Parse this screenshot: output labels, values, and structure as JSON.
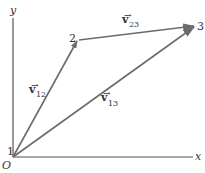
{
  "diagram": {
    "axes": {
      "x_label": "x",
      "y_label": "y",
      "origin_label": "O"
    },
    "points": [
      {
        "id": "1",
        "label": "1"
      },
      {
        "id": "2",
        "label": "2"
      },
      {
        "id": "3",
        "label": "3"
      }
    ],
    "vectors": [
      {
        "from": "1",
        "to": "2",
        "symbol": "v",
        "subscript": "12"
      },
      {
        "from": "2",
        "to": "3",
        "symbol": "v",
        "subscript": "23"
      },
      {
        "from": "1",
        "to": "3",
        "symbol": "v",
        "subscript": "13"
      }
    ],
    "colors": {
      "axis": "#555555",
      "vector": "#6b6b6b",
      "text": "#333333"
    }
  }
}
